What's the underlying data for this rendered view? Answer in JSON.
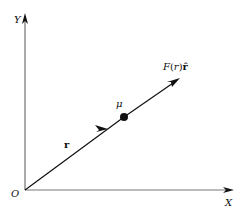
{
  "diagram": {
    "type": "vector-diagram",
    "axes": {
      "x_label": "X",
      "y_label": "Y",
      "origin_label": "O"
    },
    "position_vector": {
      "label": "r"
    },
    "particle": {
      "label": "μ"
    },
    "force_vector": {
      "label_F": "F",
      "label_open": "(",
      "label_r": "r",
      "label_close": ")",
      "label_unit": "r̂"
    },
    "colors": {
      "ink": "#111111",
      "axis": "#555555",
      "background": "#ffffff"
    }
  }
}
